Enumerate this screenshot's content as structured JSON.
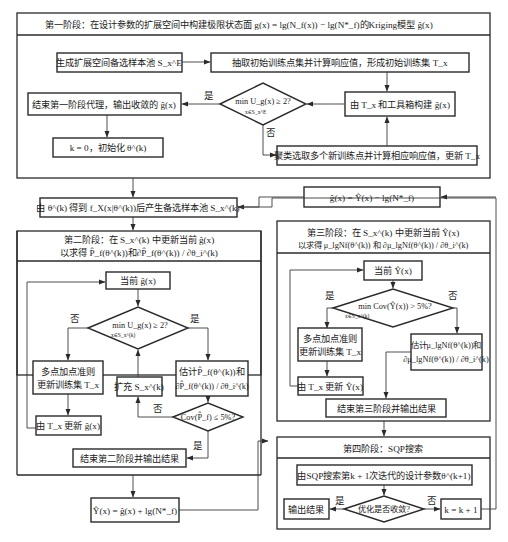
{
  "stage1": {
    "title": "第一阶段：在设计参数的扩展空间中构建极限状态面 g(x) = lg(N_f(x)) − lg(N*_f)的Kriging模型 ĝ(x)",
    "gen_pool": "生成扩展空间备选样本池 S_x^E",
    "extract_init": "抽取初始训练点集并计算响应值，形成初始训练集 T_x",
    "build_model": "由 T_x 和工具箱构建 ĝ(x)",
    "decision": "min U_g(x) ≥ 2?",
    "decision_sub": "x∈S_x^E",
    "end": "结束第一阶段代理，输出收敛的 ĝ(x)",
    "init_k": "k = 0，初始化 θ^(k)",
    "cluster": "聚类选取多个新训练点并计算相应响应值，更新 T_x",
    "yes": "是",
    "no": "否"
  },
  "pool_step": "由 θ^(k) 得到 f_X(x|θ^(k))后产生备选样本池 S_x^(k)",
  "g_from_y": "ĝ(x) = Ŷ(x) − lg(N*_f)",
  "stage2": {
    "title_line1": "第二阶段：在 S_x^(k) 中更新当前 ĝ(x)",
    "title_line2": "以求得 P̂_f(θ^(k))和∂P̂_f(θ^(k)) / ∂θ_i^(k)",
    "current": "当前 ĝ(x)",
    "decision": "min U_g(x) ≥ 2?",
    "decision_sub": "x∈S_x^(k)",
    "multi_point_l1": "多点加点准则",
    "multi_point_l2": "更新训练集 T_x",
    "update": "由 T_x 更新 ĝ(x)",
    "expand": "扩充 S_x^(k)",
    "estimate_l1": "估计P̂_f(θ^(k))和",
    "estimate_l2": "∂P̂_f(θ^(k)) / ∂θ_i^(k)",
    "cov": "Cov(P̂_f) ≤ 5%?",
    "end": "结束第二阶段并输出结果",
    "yes": "是",
    "no": "否"
  },
  "y_from_g": "Ŷ(x) = ĝ(x) + lg(N*_f)",
  "stage3": {
    "title_line1": "第三阶段：在 S_x^(k) 中更新当前 Ŷ(x)",
    "title_line2": "以求得 μ_lgNf(θ^(k)) 和 ∂μ_lgNf(θ^(k)) / ∂θ_i^(k)",
    "current": "当前 Ŷ(x)",
    "decision": "min Cov(Ŷ(x)) > 5%?",
    "decision_sub": "x∈S_x^(k)",
    "multi_point_l1": "多点加点准则",
    "multi_point_l2": "更新训练集 T_x",
    "update": "由 T_x 更新 Ŷ(x)",
    "estimate_l1": "估计μ_lgNf(θ^(k))和",
    "estimate_l2": "∂μ_lgNf(θ^(k)) / ∂θ_i^(k)",
    "end": "结束第三阶段并输出结果",
    "yes": "是",
    "no": "否"
  },
  "stage4": {
    "title": "第四阶段：SQP搜索",
    "search": "由SQP搜索第k + 1次迭代的设计参数θ^(k+1)",
    "decision": "优化是否收敛?",
    "output": "输出结果",
    "increment": "k = k + 1",
    "yes": "是",
    "no": "否"
  }
}
